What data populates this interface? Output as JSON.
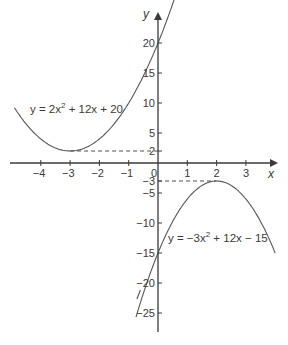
{
  "chart_data": {
    "type": "line",
    "title": "",
    "xlabel": "x",
    "ylabel": "y",
    "xlim": [
      -4.9,
      4.0
    ],
    "ylim": [
      -28,
      24
    ],
    "grid": false,
    "x_ticks": [
      -4,
      -3,
      -2,
      -1,
      0,
      1,
      2,
      3
    ],
    "x_tick_labels": [
      "−4",
      "−3",
      "−2",
      "−1",
      "0",
      "1",
      "2",
      "3"
    ],
    "y_ticks": [
      20,
      15,
      10,
      5,
      2,
      -3,
      -5,
      -10,
      -15,
      -20,
      -25
    ],
    "y_tick_labels": [
      "20",
      "15",
      "10",
      "5",
      "2",
      "−3",
      "−5",
      "−10",
      "−15",
      "−20",
      "−25"
    ],
    "series": [
      {
        "name": "y = 2x² + 12x + 20",
        "label_parts": [
          "y = 2x",
          "2",
          " + 12x + 20"
        ],
        "coefficients": {
          "a": 2,
          "b": 12,
          "c": 20
        },
        "x_range": [
          -4.9,
          0.6
        ],
        "vertex": [
          -3,
          2
        ]
      },
      {
        "name": "y = −3x² + 12x − 15",
        "label_parts": [
          "y = −3x",
          "2",
          " + 12x − 15"
        ],
        "coefficients": {
          "a": -3,
          "b": 12,
          "c": -15
        },
        "x_range": [
          -0.75,
          4.0
        ],
        "vertex": [
          2,
          -3
        ]
      }
    ],
    "annotations": [
      {
        "type": "dashed-line",
        "from": [
          -3,
          2
        ],
        "to": [
          0,
          2
        ]
      },
      {
        "type": "dashed-line",
        "from": [
          0,
          -3
        ],
        "to": [
          2,
          -3
        ]
      }
    ],
    "colors": {
      "axis": "#3a3a3a",
      "curve": "#555555",
      "text": "#3a3a3a"
    }
  }
}
